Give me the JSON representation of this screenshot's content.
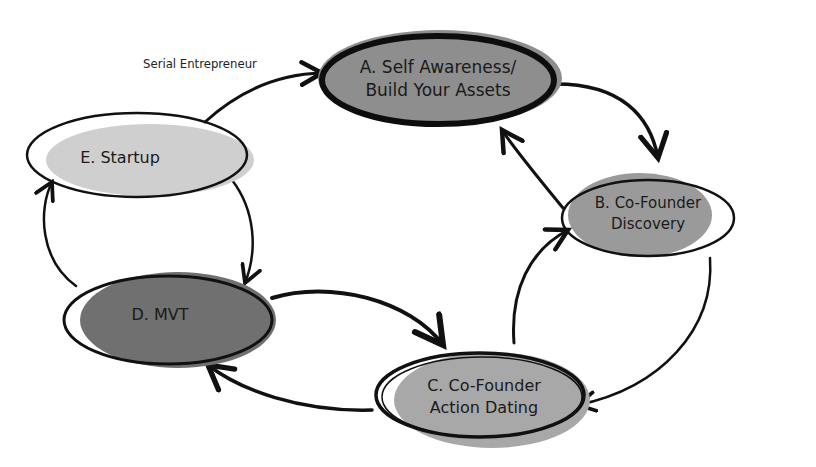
{
  "diagram": {
    "annotation": "Serial Entrepreneur",
    "nodes": [
      {
        "id": "A",
        "line1": "A. Self Awareness/",
        "line2": "Build Your Assets",
        "fill": "#8e8e8e"
      },
      {
        "id": "B",
        "line1": "B. Co-Founder",
        "line2": "Discovery",
        "fill": "#9a9a9a"
      },
      {
        "id": "C",
        "line1": "C. Co-Founder",
        "line2": "Action Dating",
        "fill": "#a8a8a8"
      },
      {
        "id": "D",
        "line1": "D. MVT",
        "fill": "#707070"
      },
      {
        "id": "E",
        "line1": "E. Startup",
        "fill": "#cfcfcf"
      }
    ],
    "edges": [
      {
        "from": "E",
        "to": "A",
        "label": "Serial Entrepreneur"
      },
      {
        "from": "A",
        "to": "B"
      },
      {
        "from": "B",
        "to": "A"
      },
      {
        "from": "B",
        "to": "C"
      },
      {
        "from": "C",
        "to": "B"
      },
      {
        "from": "C",
        "to": "D"
      },
      {
        "from": "D",
        "to": "C"
      },
      {
        "from": "D",
        "to": "E"
      },
      {
        "from": "E",
        "to": "D"
      }
    ]
  }
}
